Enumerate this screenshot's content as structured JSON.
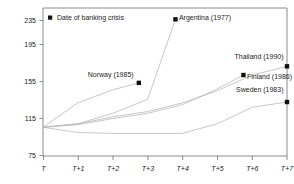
{
  "chart_data": {
    "type": "line",
    "title": "",
    "xlabel": "",
    "ylabel": "",
    "ylim": [
      75,
      245
    ],
    "xlim": [
      0,
      7
    ],
    "grid": false,
    "legend_position": "top-left",
    "legend": [
      {
        "label": "Date of banking crisis",
        "marker": "black-square"
      }
    ],
    "y_ticks": [
      75,
      115,
      155,
      195,
      235
    ],
    "y_tick_labels": [
      "75",
      "115",
      "155",
      "195",
      "235"
    ],
    "x_ticks": [
      0,
      1,
      2,
      3,
      4,
      5,
      6,
      7
    ],
    "x_tick_labels": [
      "T",
      "T+1",
      "T+2",
      "T+3",
      "T+4",
      "T+5",
      "T+6",
      "T+7"
    ],
    "series": [
      {
        "name": "Argentina (1977)",
        "x": [
          0,
          1,
          2,
          3,
          3.8
        ],
        "values": [
          108,
          112,
          124,
          140,
          232
        ],
        "crisis_marker": {
          "x": 3.8,
          "y": 232
        },
        "label": "Argentina (1977)"
      },
      {
        "name": "Norway (1985)",
        "x": [
          0,
          1,
          2,
          2.75
        ],
        "values": [
          108,
          136,
          151,
          159
        ],
        "crisis_marker": {
          "x": 2.75,
          "y": 159
        },
        "label": "Norway (1985)"
      },
      {
        "name": "Thailand (1990)",
        "x": [
          0,
          1,
          2,
          3,
          4,
          5,
          6,
          7
        ],
        "values": [
          108,
          112,
          120,
          126,
          136,
          150,
          168,
          178
        ],
        "crisis_marker": {
          "x": 7,
          "y": 178
        },
        "label": "Thailand (1990)"
      },
      {
        "name": "Finland (1986)",
        "x": [
          0,
          1,
          2,
          3,
          4,
          5,
          5.75
        ],
        "values": [
          108,
          111,
          118,
          124,
          134,
          152,
          168
        ],
        "crisis_marker": {
          "x": 5.75,
          "y": 168
        },
        "label": "Finland (1986)"
      },
      {
        "name": "Sweden (1983)",
        "x": [
          0,
          1,
          2,
          3,
          4,
          5,
          6,
          7
        ],
        "values": [
          108,
          102,
          101,
          101,
          101,
          112,
          131,
          137
        ],
        "crisis_marker": {
          "x": 7,
          "y": 137
        },
        "label": "Sweden (1983)"
      }
    ],
    "annotations": [
      {
        "text": "Argentina (1977)",
        "x": 3.9,
        "y": 231,
        "anchor": "start"
      },
      {
        "text": "Norway (1985)",
        "x": 2.6,
        "y": 166,
        "anchor": "end"
      },
      {
        "text": "Thailand (1990)",
        "x": 6.9,
        "y": 186,
        "anchor": "end"
      },
      {
        "text": "Finland (1986)",
        "x": 5.85,
        "y": 163,
        "anchor": "start"
      },
      {
        "text": "Sweden (1983)",
        "x": 6.9,
        "y": 148,
        "anchor": "end"
      }
    ]
  }
}
